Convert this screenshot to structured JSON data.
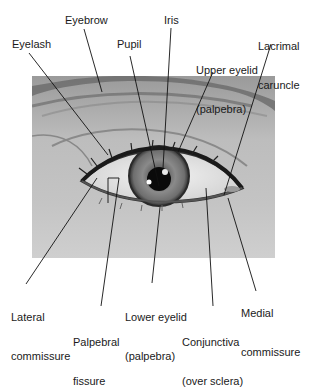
{
  "figure": {
    "labels": [
      {
        "id": "eyebrow",
        "text": "Eyebrow",
        "x": 65,
        "y": 14
      },
      {
        "id": "iris",
        "text": "Iris",
        "x": 164,
        "y": 14
      },
      {
        "id": "lacrimal-caruncle",
        "line1": "Lacrimal",
        "line2": "caruncle",
        "x": 258,
        "y": 14
      },
      {
        "id": "eyelash",
        "text": "Eyelash",
        "x": 12,
        "y": 38
      },
      {
        "id": "pupil",
        "text": "Pupil",
        "x": 117,
        "y": 38
      },
      {
        "id": "upper-eyelid",
        "line1": "Upper eyelid",
        "line2": "(palpebra)",
        "x": 196,
        "y": 38
      },
      {
        "id": "lateral-commissure",
        "line1": "Lateral",
        "line2": "commissure",
        "x": 11,
        "y": 285
      },
      {
        "id": "lower-eyelid",
        "line1": "Lower eyelid",
        "line2": "(palpebra)",
        "x": 125,
        "y": 285
      },
      {
        "id": "medial-commissure",
        "line1": "Medial",
        "line2": "commissure",
        "x": 241,
        "y": 281
      },
      {
        "id": "palpebral-fissure",
        "line1": "Palpebral",
        "line2": "fissure",
        "x": 73,
        "y": 310
      },
      {
        "id": "conjunctiva",
        "line1": "Conjunctiva",
        "line2": "(over sclera)",
        "x": 182,
        "y": 310
      }
    ],
    "colors": {
      "text": "#1a1a1a",
      "leader_line": "#111111",
      "background": "#ffffff"
    }
  }
}
